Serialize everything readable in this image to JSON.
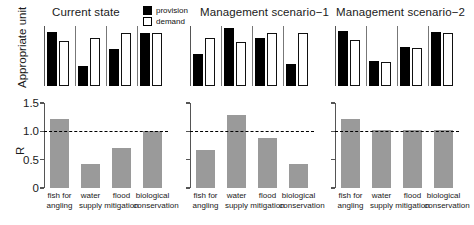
{
  "figure": {
    "legend": {
      "position": "top-center",
      "entries": [
        {
          "label": "provision",
          "swatch": "filled-black-square",
          "color": "#000000"
        },
        {
          "label": "demand",
          "swatch": "hollow-white-square",
          "color": "#ffffff"
        }
      ]
    },
    "top_ylabel": "Appropriate unit",
    "bottom_ylabel": "R",
    "panel_titles": [
      "Current state",
      "Management scenario−1",
      "Management scenario−2"
    ]
  },
  "chart_data": [
    {
      "type": "bar",
      "title": "Current state",
      "subtitle": "",
      "xlabel": "",
      "ylabel": "Appropriate unit",
      "grid": false,
      "legend_position": "top-center",
      "categories": [
        "fish for angling",
        "water supply",
        "flood mitigation",
        "biological conservation"
      ],
      "series": [
        {
          "name": "provision",
          "values": [
            0.9,
            0.34,
            0.62,
            0.88
          ]
        },
        {
          "name": "demand",
          "values": [
            0.75,
            0.8,
            0.88,
            0.88
          ]
        }
      ],
      "ylim": [
        0,
        1
      ]
    },
    {
      "type": "bar",
      "title": "Management scenario−1",
      "subtitle": "",
      "xlabel": "",
      "ylabel": "Appropriate unit",
      "grid": false,
      "legend_position": "top-center",
      "categories": [
        "fish for angling",
        "water supply",
        "flood mitigation",
        "biological conservation"
      ],
      "series": [
        {
          "name": "provision",
          "values": [
            0.53,
            0.96,
            0.8,
            0.37
          ]
        },
        {
          "name": "demand",
          "values": [
            0.8,
            0.74,
            0.88,
            0.88
          ]
        }
      ],
      "ylim": [
        0,
        1
      ]
    },
    {
      "type": "bar",
      "title": "Management scenario−2",
      "subtitle": "",
      "xlabel": "",
      "ylabel": "Appropriate unit",
      "grid": false,
      "legend_position": "top-center",
      "categories": [
        "fish for angling",
        "water supply",
        "flood mitigation",
        "biological conservation"
      ],
      "series": [
        {
          "name": "provision",
          "values": [
            0.92,
            0.41,
            0.65,
            0.9
          ]
        },
        {
          "name": "demand",
          "values": [
            0.76,
            0.4,
            0.63,
            0.88
          ]
        }
      ],
      "ylim": [
        0,
        1
      ]
    },
    {
      "type": "bar",
      "title": "",
      "subtitle": "Current state",
      "xlabel": "",
      "ylabel": "R",
      "grid": false,
      "legend_position": "none",
      "categories": [
        "fish for angling",
        "water supply",
        "flood mitigation",
        "biological conservation"
      ],
      "values": [
        1.21,
        0.42,
        0.71,
        1.0
      ],
      "yticks": [
        0,
        0.5,
        1.0,
        1.5
      ],
      "ytick_labels": [
        "0",
        "0.5",
        "1.0",
        "1.5"
      ],
      "ylim": [
        0,
        1.5
      ],
      "reference_line": 1.0
    },
    {
      "type": "bar",
      "title": "",
      "subtitle": "Management scenario−1",
      "xlabel": "",
      "ylabel": "R",
      "grid": false,
      "legend_position": "none",
      "categories": [
        "fish for angling",
        "water supply",
        "flood mitigation",
        "biological conservation"
      ],
      "values": [
        0.67,
        1.29,
        0.89,
        0.42
      ],
      "yticks": [
        0,
        0.5,
        1.0,
        1.5
      ],
      "ytick_labels": [
        "0",
        "0.5",
        "1.0",
        "1.5"
      ],
      "ylim": [
        0,
        1.5
      ],
      "reference_line": 1.0
    },
    {
      "type": "bar",
      "title": "",
      "subtitle": "Management scenario−2",
      "xlabel": "",
      "ylabel": "R",
      "grid": false,
      "legend_position": "none",
      "categories": [
        "fish for angling",
        "water supply",
        "flood mitigation",
        "biological conservation"
      ],
      "values": [
        1.21,
        1.03,
        1.03,
        1.03
      ],
      "yticks": [
        0,
        0.5,
        1.0,
        1.5
      ],
      "ytick_labels": [
        "0",
        "0.5",
        "1.0",
        "1.5"
      ],
      "ylim": [
        0,
        1.5
      ],
      "reference_line": 1.0
    }
  ],
  "xtick_label_lines": [
    [
      "fish for",
      "angling"
    ],
    [
      "water",
      "supply"
    ],
    [
      "flood",
      "mitigation"
    ],
    [
      "biological",
      "conservation"
    ]
  ]
}
